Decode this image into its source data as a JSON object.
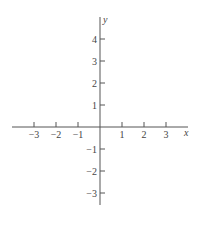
{
  "chart_data": {
    "type": "line",
    "title": "",
    "xlabel": "x",
    "ylabel": "y",
    "xlim": [
      -4,
      4
    ],
    "ylim": [
      -4,
      5
    ],
    "grid": false,
    "x_ticks": [
      -3,
      -2,
      -1,
      1,
      2,
      3
    ],
    "y_ticks": [
      4,
      3,
      2,
      1,
      -1,
      -2,
      -3
    ],
    "x_tick_labels": [
      "−3",
      "−2",
      "−1",
      "1",
      "2",
      "3"
    ],
    "y_tick_labels": [
      "4",
      "3",
      "2",
      "1",
      "−1",
      "−2",
      "−3"
    ],
    "series": []
  },
  "labels": {
    "x_axis": "x",
    "y_axis": "y"
  },
  "colors": {
    "axis": "#555555",
    "text": "#444444"
  }
}
